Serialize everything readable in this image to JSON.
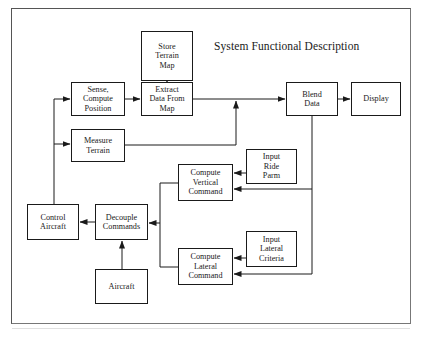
{
  "diagram": {
    "title": "System Functional Description",
    "nodes": {
      "store_terrain_map": "Store\nTerrain\nMap",
      "sense_compute_position": "Sense,\nCompute\nPosition",
      "extract_data_from_map": "Extract\nData From\nMap",
      "measure_terrain": "Measure\nTerrain",
      "blend_data": "Blend\nData",
      "display": "Display",
      "compute_vertical_command": "Compute\nVertical\nCommand",
      "input_ride_parm": "Input\nRide\nParm",
      "control_aircraft": "Control\nAircraft",
      "decouple_commands": "Decouple\nCommands",
      "aircraft": "Aircraft",
      "compute_lateral_command": "Compute\nLateral\nCommand",
      "input_lateral_criteria": "Input\nLateral\nCriteria"
    },
    "edges": [
      {
        "from": "Store Terrain Map",
        "to": "Extract Data From Map"
      },
      {
        "from": "Sense, Compute Position",
        "to": "Extract Data From Map"
      },
      {
        "from": "Extract Data From Map",
        "to": "Blend Data"
      },
      {
        "from": "Measure Terrain",
        "to": "Blend Data"
      },
      {
        "from": "Blend Data",
        "to": "Display"
      },
      {
        "from": "Blend Data",
        "to": "Compute Vertical Command"
      },
      {
        "from": "Blend Data",
        "to": "Compute Lateral Command"
      },
      {
        "from": "Input Ride Parm",
        "to": "Compute Vertical Command"
      },
      {
        "from": "Input Lateral Criteria",
        "to": "Compute Lateral Command"
      },
      {
        "from": "Compute Vertical Command",
        "to": "Decouple Commands"
      },
      {
        "from": "Compute Lateral Command",
        "to": "Decouple Commands"
      },
      {
        "from": "Aircraft",
        "to": "Decouple Commands"
      },
      {
        "from": "Decouple Commands",
        "to": "Control Aircraft"
      },
      {
        "from": "Control Aircraft",
        "to": "Sense, Compute Position"
      },
      {
        "from": "Control Aircraft",
        "to": "Measure Terrain"
      }
    ],
    "colors": {
      "line": "#1a1a1a",
      "frame": "#555555",
      "background": "#ffffff"
    }
  }
}
